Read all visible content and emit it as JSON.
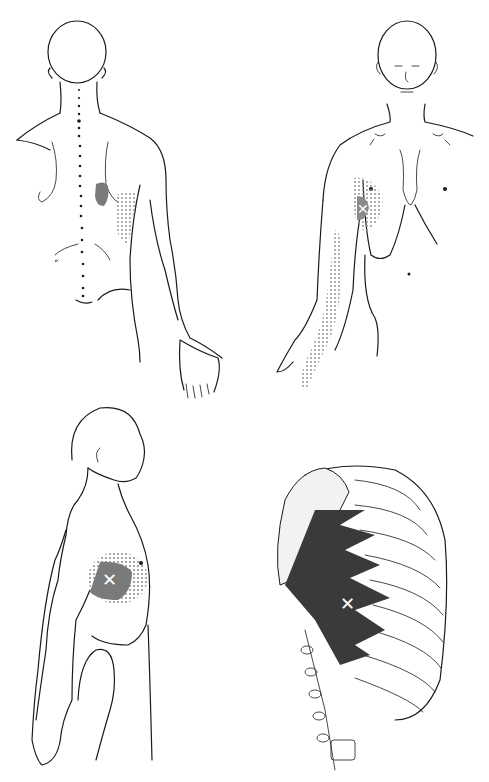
{
  "figure": {
    "panels": [
      {
        "id": "posterior-view",
        "description": "Back view of torso with referred pain zone near inferior angle of scapula and along arm"
      },
      {
        "id": "anterior-view",
        "description": "Front view with referred pain at lateral chest and down the inner arm to the hand"
      },
      {
        "id": "lateral-view",
        "description": "Side view with trigger point marked X on lateral chest wall"
      },
      {
        "id": "anatomy-view",
        "description": "Rib cage with serratus anterior muscle slips and trigger point X"
      }
    ],
    "marker_symbol": "✕",
    "colors": {
      "line": "#1a1a1a",
      "pain_essential": "#7a7a7a",
      "pain_spillover": "#9a9a9a",
      "muscle": "#3a3a3a",
      "background": "#ffffff"
    }
  }
}
